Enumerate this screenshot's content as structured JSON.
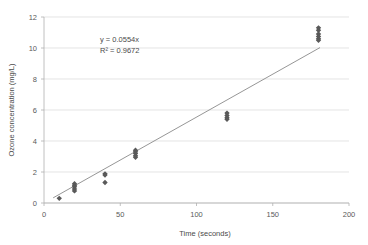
{
  "chart_data": {
    "type": "scatter",
    "title": "",
    "xlabel": "Time (seconds)",
    "ylabel": "Ozone concentration (mg/L)",
    "xlim": [
      0,
      200
    ],
    "ylim": [
      0,
      12
    ],
    "xticks": [
      0,
      50,
      100,
      150,
      200
    ],
    "yticks": [
      0,
      2,
      4,
      6,
      8,
      10,
      12
    ],
    "grid": "horizontal",
    "legend": "none",
    "marker_shape": "diamond",
    "marker_color": "#595959",
    "trendline_color": "#8a8a8a",
    "gridline_color": "#d9d9d9",
    "annotations": {
      "equation": "y = 0.0554x",
      "r_squared": "R² = 0.9672"
    },
    "trendline": {
      "slope": 0.0554,
      "intercept": 0,
      "x_start": 6,
      "x_end": 181
    },
    "points": [
      {
        "x": 10,
        "y": 0.3
      },
      {
        "x": 20,
        "y": 1.25
      },
      {
        "x": 20,
        "y": 1.15
      },
      {
        "x": 20,
        "y": 1.05
      },
      {
        "x": 20,
        "y": 0.9
      },
      {
        "x": 20,
        "y": 0.78
      },
      {
        "x": 40,
        "y": 1.88
      },
      {
        "x": 40,
        "y": 1.8
      },
      {
        "x": 40,
        "y": 1.32
      },
      {
        "x": 60,
        "y": 3.4
      },
      {
        "x": 60,
        "y": 3.3
      },
      {
        "x": 60,
        "y": 3.2
      },
      {
        "x": 60,
        "y": 3.05
      },
      {
        "x": 60,
        "y": 2.95
      },
      {
        "x": 120,
        "y": 5.8
      },
      {
        "x": 120,
        "y": 5.65
      },
      {
        "x": 120,
        "y": 5.5
      },
      {
        "x": 120,
        "y": 5.4
      },
      {
        "x": 180,
        "y": 11.3
      },
      {
        "x": 180,
        "y": 11.15
      },
      {
        "x": 180,
        "y": 10.9
      },
      {
        "x": 180,
        "y": 10.75
      },
      {
        "x": 180,
        "y": 10.6
      },
      {
        "x": 180,
        "y": 10.5
      }
    ]
  },
  "axes": {
    "x_tick_labels": [
      "0",
      "50",
      "100",
      "150",
      "200"
    ],
    "y_tick_labels": [
      "0",
      "2",
      "4",
      "6",
      "8",
      "10",
      "12"
    ]
  }
}
